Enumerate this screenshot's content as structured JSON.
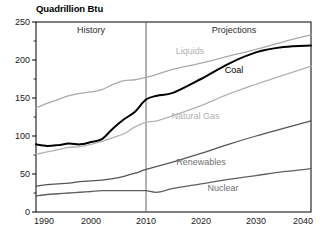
{
  "chart_data": {
    "type": "line",
    "title": "Quadrillion Btu",
    "xlabel": "",
    "ylabel": "Quadrillion Btu",
    "xlim": [
      1990,
      2040
    ],
    "ylim": [
      0,
      250
    ],
    "grid": false,
    "legend": "inline-labels",
    "x_ticks": [
      "1990",
      "2000",
      "2010",
      "2020",
      "2030",
      "2040"
    ],
    "y_ticks": [
      "0",
      "50",
      "100",
      "150",
      "200",
      "250"
    ],
    "annotations": [
      {
        "text": "History",
        "x": 2000,
        "y": 240
      },
      {
        "text": "Projections",
        "x": 2026,
        "y": 240
      }
    ],
    "divider_year": 2010,
    "x": [
      1990,
      1992,
      1994,
      1996,
      1998,
      2000,
      2002,
      2004,
      2006,
      2008,
      2010,
      2012,
      2015,
      2020,
      2025,
      2030,
      2035,
      2040
    ],
    "series": [
      {
        "name": "Liquids",
        "color": "#aaaaaa",
        "label_x": 2018,
        "label_y": 208,
        "values": [
          137,
          143,
          148,
          153,
          156,
          158,
          161,
          168,
          173,
          174,
          177,
          181,
          188,
          196,
          205,
          214,
          224,
          233
        ]
      },
      {
        "name": "Coal",
        "color": "#000000",
        "label_x": 2026,
        "label_y": 183,
        "values": [
          89,
          87,
          88,
          90,
          89,
          92,
          96,
          110,
          122,
          132,
          148,
          153,
          157,
          175,
          195,
          210,
          217,
          219
        ]
      },
      {
        "name": "Natural Gas",
        "color": "#b2b2b2",
        "label_x": 2019,
        "label_y": 122,
        "values": [
          76,
          79,
          82,
          85,
          86,
          89,
          93,
          98,
          103,
          112,
          118,
          120,
          127,
          140,
          155,
          168,
          180,
          192
        ]
      },
      {
        "name": "Renewables",
        "color": "#555555",
        "label_x": 2020,
        "label_y": 62,
        "values": [
          34,
          36,
          37,
          38,
          40,
          41,
          42,
          44,
          47,
          51,
          56,
          60,
          66,
          77,
          89,
          100,
          110,
          120
        ]
      },
      {
        "name": "Nuclear",
        "color": "#606060",
        "label_x": 2024,
        "label_y": 28,
        "values": [
          21,
          23,
          24,
          25,
          26,
          27,
          28,
          28,
          28,
          28,
          28,
          26,
          31,
          37,
          43,
          48,
          53,
          57
        ]
      }
    ]
  },
  "plot": {
    "left": 36,
    "right": 311,
    "top": 22,
    "bottom": 212
  }
}
